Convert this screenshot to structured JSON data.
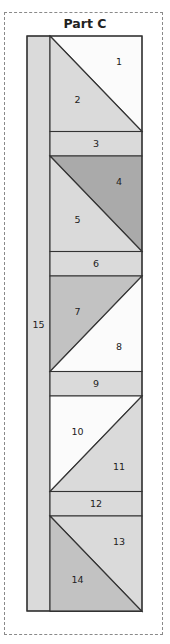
{
  "title": "Part C",
  "colors": {
    "white": "#fbfbfb",
    "light": "#dadada",
    "mid": "#c2c2c2",
    "dark": "#aaaaaa",
    "line": "#333333",
    "dash": "#8a8a8a"
  },
  "strip": {
    "label": "15",
    "color": "light"
  },
  "blocks": [
    {
      "type": "triangles",
      "diagonal": "tl-br",
      "upper": {
        "label": "1",
        "color": "white"
      },
      "lower": {
        "label": "2",
        "color": "light"
      }
    },
    {
      "type": "strip",
      "label": "3",
      "color": "light"
    },
    {
      "type": "triangles",
      "diagonal": "tl-br",
      "upper": {
        "label": "4",
        "color": "dark"
      },
      "lower": {
        "label": "5",
        "color": "light"
      }
    },
    {
      "type": "strip",
      "label": "6",
      "color": "light"
    },
    {
      "type": "triangles",
      "diagonal": "bl-tr",
      "upper": {
        "label": "7",
        "color": "mid"
      },
      "lower": {
        "label": "8",
        "color": "white"
      }
    },
    {
      "type": "strip",
      "label": "9",
      "color": "light"
    },
    {
      "type": "triangles",
      "diagonal": "bl-tr",
      "upper": {
        "label": "10",
        "color": "white"
      },
      "lower": {
        "label": "11",
        "color": "light"
      }
    },
    {
      "type": "strip",
      "label": "12",
      "color": "light"
    },
    {
      "type": "triangles",
      "diagonal": "tl-br",
      "upper": {
        "label": "13",
        "color": "light"
      },
      "lower": {
        "label": "14",
        "color": "mid"
      }
    }
  ]
}
